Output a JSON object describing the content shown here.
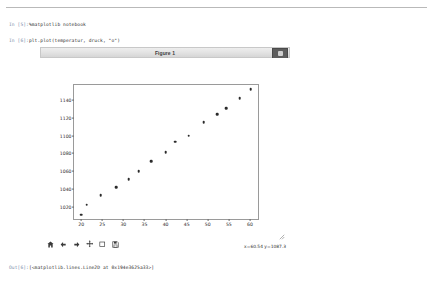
{
  "notebook": {
    "cells": [
      {
        "prompt": "In [5]:",
        "code": "%matplotlib notebook"
      },
      {
        "prompt": "In [6]:",
        "code": "plt.plot(temperatur, druck, \"o\")"
      }
    ],
    "output": {
      "prompt": "Out[6]:",
      "text": "[<matplotlib.lines.Line2D at 0x194e3625a33>]"
    }
  },
  "figure": {
    "title": "Figure 1",
    "close_button_icon": "stop-square-icon",
    "toolbar": [
      {
        "name": "home-button",
        "icon": "home-icon"
      },
      {
        "name": "back-button",
        "icon": "arrow-left-icon"
      },
      {
        "name": "forward-button",
        "icon": "arrow-right-icon"
      },
      {
        "name": "pan-button",
        "icon": "move-cross-icon"
      },
      {
        "name": "zoom-button",
        "icon": "zoom-rectangle-icon"
      },
      {
        "name": "save-button",
        "icon": "floppy-disk-icon"
      }
    ],
    "coordinate_readout": "x=60.54 y=1087.3",
    "resize_grip_icon": "resize-corner-icon"
  },
  "colors": {
    "marker": "#2b2b2b",
    "axis": "#9a9a9a",
    "titlebar_bg": "#e3e3e3",
    "close_button_bg": "#5d5d5d",
    "prompt_text": "#7a8ca8"
  },
  "chart_data": {
    "type": "scatter",
    "title": "",
    "xlabel": "",
    "ylabel": "",
    "marker": "o",
    "grid": false,
    "legend": null,
    "xlim": [
      18.3,
      61.9
    ],
    "ylim": [
      1006.0,
      1157.0
    ],
    "xticks": [
      20,
      25,
      30,
      35,
      40,
      45,
      50,
      55,
      60
    ],
    "yticks": [
      1020,
      1040,
      1060,
      1080,
      1100,
      1120,
      1140
    ],
    "x": [
      20.0,
      21.3,
      24.6,
      28.3,
      31.3,
      33.6,
      36.6,
      40.0,
      42.3,
      45.5,
      49.0,
      52.3,
      54.3,
      57.6,
      60.2
    ],
    "y": [
      1011,
      1022,
      1033,
      1042,
      1051,
      1060,
      1071,
      1081,
      1093,
      1100,
      1115,
      1124,
      1131,
      1142,
      1152
    ],
    "series_name": "druck vs temperatur"
  }
}
